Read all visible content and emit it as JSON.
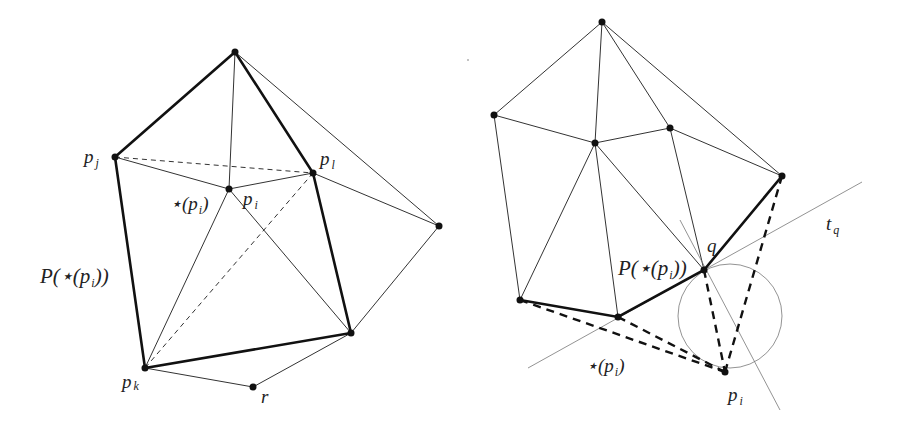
{
  "figure": {
    "left_panel": {
      "labels": {
        "pj": "p",
        "pj_sub": "j",
        "pl": "p",
        "pl_sub": "l",
        "pi": "p",
        "pi_sub": "i",
        "star_pi_prefix": "⋆(p",
        "star_pi_sub": "i",
        "star_pi_suffix": ")",
        "P_star_prefix": "P(⋆(p",
        "P_star_sub": "i",
        "P_star_suffix": "))",
        "pk": "p",
        "pk_sub": "k",
        "r": "r"
      },
      "points": {
        "top": [
          235,
          52
        ],
        "pj": [
          115,
          157
        ],
        "pl": [
          313,
          173
        ],
        "pi": [
          229,
          189
        ],
        "right": [
          439,
          226
        ],
        "bottom_right": [
          351,
          333
        ],
        "pk": [
          145,
          368
        ],
        "r": [
          253,
          387
        ]
      }
    },
    "right_panel": {
      "labels": {
        "q": "q",
        "tq": "t",
        "tq_sub": "q",
        "P_star_prefix": "P(⋆(p",
        "P_star_sub": "i",
        "P_star_suffix": "))",
        "star_pi_prefix": "⋆(p",
        "star_pi_sub": "i",
        "star_pi_suffix": ")",
        "pi": "p",
        "pi_sub": "i"
      },
      "points": {
        "top": [
          602,
          22
        ],
        "left": [
          494,
          115
        ],
        "center": [
          595,
          143
        ],
        "mid_right": [
          670,
          128
        ],
        "right": [
          782,
          176
        ],
        "q": [
          704,
          270
        ],
        "bottom_left": [
          520,
          300
        ],
        "bottom_mid": [
          618,
          317
        ],
        "pi": [
          725,
          372
        ]
      },
      "circle": {
        "center": [
          730,
          316
        ],
        "radius": 52
      }
    }
  }
}
